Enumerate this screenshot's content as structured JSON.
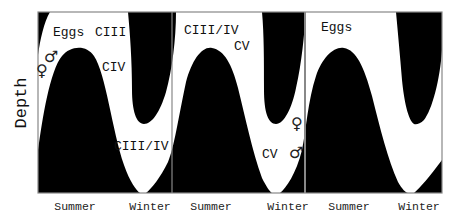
{
  "diagram": {
    "type": "seasonal vertical migration diagram",
    "ylabel": "Depth",
    "x_ticks": [
      "Summer",
      "Winter",
      "Summer",
      "Winter",
      "Summer",
      "Winter"
    ],
    "colors": {
      "fill": "#000000",
      "background": "#ffffff",
      "frame": "#888888"
    },
    "panels": [
      {
        "labels": {
          "eggs": "Eggs",
          "ciii": "CIII",
          "civ": "CIV",
          "ciii_iv": "CIII/IV",
          "male": "♂",
          "female": "♀"
        }
      },
      {
        "labels": {
          "ciii_iv": "CIII/IV",
          "cv_top": "CV",
          "female": "♀",
          "cv_bottom": "CV",
          "male": "♂"
        }
      },
      {
        "labels": {
          "eggs": "Eggs"
        }
      }
    ]
  }
}
